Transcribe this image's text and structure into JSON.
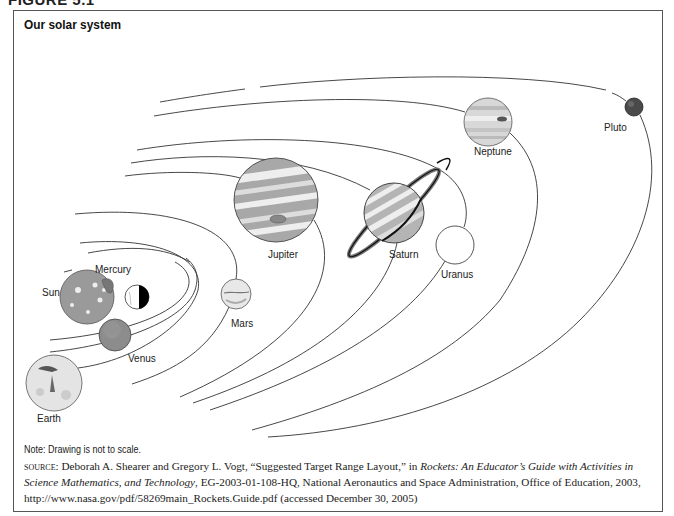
{
  "figure": {
    "header": "FIGURE 5.1",
    "title": "Our solar system"
  },
  "bodies": [
    {
      "name": "Sun",
      "label": "Sun",
      "cx": 87,
      "cy": 297,
      "r": 27,
      "color": "#9a9a9a"
    },
    {
      "name": "Mercury",
      "label": "Mercury",
      "cx": 137,
      "cy": 297,
      "r": 12,
      "color": "#ffffff"
    },
    {
      "name": "Venus",
      "label": "Venus",
      "cx": 115,
      "cy": 335,
      "r": 16,
      "color": "#8c8c8c"
    },
    {
      "name": "Earth",
      "label": "Earth",
      "cx": 54,
      "cy": 383,
      "r": 28,
      "color": "#e4e4e4"
    },
    {
      "name": "Mars",
      "label": "Mars",
      "cx": 236,
      "cy": 294,
      "r": 15,
      "color": "#e0e0e0"
    },
    {
      "name": "Jupiter",
      "label": "Jupiter",
      "cx": 276,
      "cy": 200,
      "r": 42,
      "color": "#aaaaaa"
    },
    {
      "name": "Saturn",
      "label": "Saturn",
      "cx": 394,
      "cy": 213,
      "r": 30,
      "color": "#b4b4b4"
    },
    {
      "name": "Uranus",
      "label": "Uranus",
      "cx": 455,
      "cy": 245,
      "r": 19,
      "color": "#ffffff"
    },
    {
      "name": "Neptune",
      "label": "Neptune",
      "cx": 488,
      "cy": 122,
      "r": 24,
      "color": "#d8d8d8"
    },
    {
      "name": "Pluto",
      "label": "Pluto",
      "cx": 634,
      "cy": 107,
      "r": 9,
      "color": "#4a4a4a"
    }
  ],
  "note": "Note: Drawing is not to scale.",
  "source": {
    "prefix": "source:",
    "text1": " Deborah A. Shearer and Gregory L. Vogt, “Suggested Target Range Layout,” in ",
    "italic": "Rockets: An Educator’s Guide with Activities in Science Mathematics, and Technology",
    "text2": ", EG-2003-01-108-HQ, National Aeronautics and Space Administration, Office of Education, 2003, http://www.nasa.gov/pdf/58269main_Rockets.Guide.pdf (accessed December 30, 2005)"
  }
}
